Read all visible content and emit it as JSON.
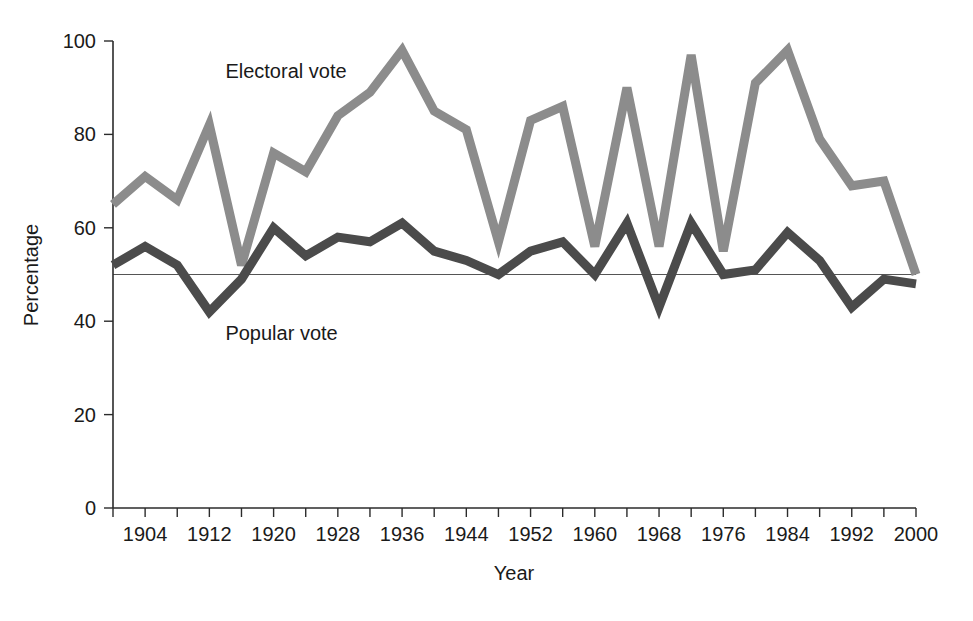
{
  "chart_data": {
    "type": "line",
    "title": "",
    "xlabel": "Year",
    "ylabel": "Percentage",
    "xlim": [
      1900,
      2000
    ],
    "ylim": [
      0,
      100
    ],
    "grid": false,
    "legend_position": "inline-annotations",
    "x": [
      1900,
      1904,
      1908,
      1912,
      1916,
      1920,
      1924,
      1928,
      1932,
      1936,
      1940,
      1944,
      1948,
      1952,
      1956,
      1960,
      1964,
      1968,
      1972,
      1976,
      1980,
      1984,
      1988,
      1992,
      1996,
      2000
    ],
    "x_tick_values": [
      1904,
      1912,
      1920,
      1928,
      1936,
      1944,
      1952,
      1960,
      1968,
      1976,
      1984,
      1992,
      2000
    ],
    "x_tick_labels": [
      "1904",
      "1912",
      "1920",
      "1928",
      "1936",
      "1944",
      "1952",
      "1960",
      "1968",
      "1976",
      "1984",
      "1992",
      "2000"
    ],
    "x_minor_tick_interval": 4,
    "y_tick_values": [
      0,
      20,
      40,
      60,
      80,
      100
    ],
    "y_tick_labels": [
      "0",
      "20",
      "40",
      "60",
      "80",
      "100"
    ],
    "reference_line_y": 50,
    "series": [
      {
        "name": "Electoral vote",
        "color": "#8c8c8c",
        "stroke_width": 9,
        "label_x": 1914,
        "label_y": 92,
        "values": [
          65,
          71,
          66,
          82,
          52,
          76,
          72,
          84,
          89,
          98,
          85,
          81,
          57,
          83,
          86,
          56,
          90,
          56,
          97,
          55,
          91,
          98,
          79,
          69,
          70,
          50
        ]
      },
      {
        "name": "Popular vote",
        "color": "#4b4b4b",
        "stroke_width": 9,
        "label_x": 1914,
        "label_y": 36,
        "values": [
          52,
          56,
          52,
          42,
          49,
          60,
          54,
          58,
          57,
          61,
          55,
          53,
          50,
          55,
          57,
          50,
          61,
          43,
          61,
          50,
          51,
          59,
          53,
          43,
          49,
          48
        ]
      }
    ],
    "annotations": [
      {
        "text": "Electoral vote",
        "x": 1914,
        "y": 92
      },
      {
        "text": "Popular vote",
        "x": 1914,
        "y": 36
      }
    ]
  },
  "axes": {
    "y_title": "Percentage",
    "x_title": "Year",
    "y_labels": [
      "100",
      "80",
      "60",
      "40",
      "20",
      "0"
    ],
    "x_labels": [
      "1904",
      "1912",
      "1920",
      "1928",
      "1936",
      "1944",
      "1952",
      "1960",
      "1968",
      "1976",
      "1984",
      "1992",
      "2000"
    ]
  },
  "series_labels": {
    "electoral": "Electoral vote",
    "popular": "Popular vote"
  },
  "colors": {
    "electoral": "#8c8c8c",
    "popular": "#4b4b4b",
    "axis": "#2b2b2b",
    "reference": "#555555",
    "background": "#ffffff"
  }
}
